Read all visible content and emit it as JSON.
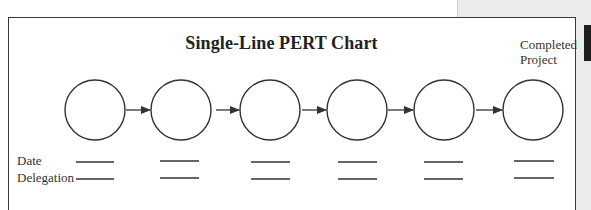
{
  "diagram": {
    "title": "Single-Line PERT Chart",
    "end_label_line1": "Completed",
    "end_label_line2": "Project",
    "row_labels": {
      "date": "Date",
      "delegation": "Delegation"
    },
    "node_count": 6,
    "nodes": [
      {
        "id": 1,
        "cx": 95
      },
      {
        "id": 2,
        "cx": 181
      },
      {
        "id": 3,
        "cx": 270
      },
      {
        "id": 4,
        "cx": 357
      },
      {
        "id": 5,
        "cx": 444
      },
      {
        "id": 6,
        "cx": 533,
        "label": "Completed Project"
      }
    ],
    "edges": [
      [
        1,
        2
      ],
      [
        2,
        3
      ],
      [
        3,
        4
      ],
      [
        4,
        5
      ],
      [
        5,
        6
      ]
    ],
    "colors": {
      "stroke": "#333333",
      "frame": "#3a3a3a",
      "side_band": "#ececec"
    }
  }
}
